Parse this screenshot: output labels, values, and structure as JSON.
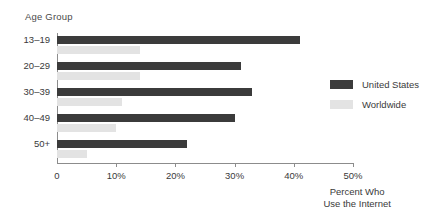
{
  "chart_data": {
    "type": "bar",
    "orientation": "horizontal",
    "title": "",
    "xlabel": "Percent Who Use the Internet",
    "ylabel": "Age Group",
    "categories": [
      "13–19",
      "20–29",
      "30–39",
      "40–49",
      "50+"
    ],
    "series": [
      {
        "name": "United States",
        "color": "#3b3b3b",
        "values": [
          41,
          31,
          33,
          30,
          22
        ]
      },
      {
        "name": "Worldwide",
        "color": "#e3e3e3",
        "values": [
          14,
          14,
          11,
          10,
          5
        ]
      }
    ],
    "xlim": [
      0,
      50
    ],
    "xticks": [
      0,
      10,
      20,
      30,
      40,
      50
    ],
    "xtick_labels": [
      "0",
      "10%",
      "20%",
      "30%",
      "40%",
      "50%"
    ],
    "grid": false,
    "legend_position": "right"
  },
  "axes": {
    "category_axis_title": "Age Group",
    "value_axis_title_line1": "Percent Who",
    "value_axis_title_line2": "Use the Internet"
  },
  "legend": {
    "entries": [
      {
        "label": "United States",
        "swatch_color": "#3b3b3b"
      },
      {
        "label": "Worldwide",
        "swatch_color": "#e3e3e3"
      }
    ]
  },
  "colors": {
    "background": "#ffffff",
    "axis_line": "#8c8c8c",
    "text": "#3a3a3a",
    "series_united_states": "#3b3b3b",
    "series_worldwide": "#e3e3e3"
  }
}
